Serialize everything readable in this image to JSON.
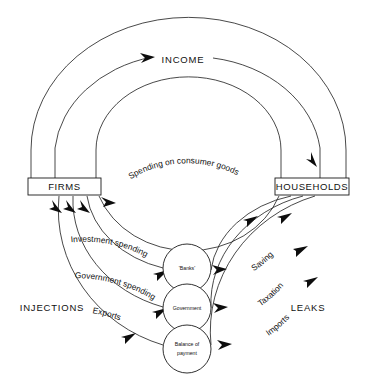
{
  "diagram": {
    "background_color": "#ffffff",
    "line_color": "#1a1a1a",
    "text_color": "#111111"
  },
  "sectors": {
    "firms": "FIRMS",
    "households": "HOUSEHOLDS"
  },
  "intermediaries": [
    {
      "id": "banks",
      "label": "'Banks'",
      "line1": "'Banks'",
      "line2": ""
    },
    {
      "id": "government",
      "label": "Government",
      "line1": "Government",
      "line2": ""
    },
    {
      "id": "balance-of-payment",
      "label": "Balance of payment",
      "line1": "Balance of",
      "line2": "payment"
    }
  ],
  "side_labels": {
    "injections": "INJECTIONS",
    "leaks": "LEAKS"
  },
  "top_flow": {
    "label": "INCOME",
    "direction": "firms-to-households"
  },
  "injection_flows": [
    {
      "id": "investment-spending",
      "label": "Investment spending",
      "from": "'Banks'",
      "to": "FIRMS"
    },
    {
      "id": "government-spending",
      "label": "Government spending",
      "from": "Government",
      "to": "FIRMS"
    },
    {
      "id": "exports",
      "label": "Exports",
      "from": "Balance of payment",
      "to": "FIRMS"
    }
  ],
  "leak_flows": [
    {
      "id": "saving",
      "label": "Saving",
      "from": "HOUSEHOLDS",
      "to": "'Banks'"
    },
    {
      "id": "taxation",
      "label": "Taxation",
      "from": "HOUSEHOLDS",
      "to": "Government"
    },
    {
      "id": "imports",
      "label": "Imports",
      "from": "HOUSEHOLDS",
      "to": "Balance of payment"
    }
  ],
  "spending_flow": {
    "id": "spending-on-consumer-goods",
    "label": "Spending on consumer goods",
    "from": "HOUSEHOLDS",
    "to": "FIRMS"
  }
}
